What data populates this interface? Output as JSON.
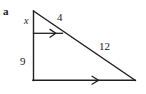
{
  "figure": {
    "part_label": "a",
    "stroke_color": "#231f20",
    "background_color": "#ffffff",
    "labels": {
      "upper_left_side": "x",
      "upper_hypotenuse_segment": "4",
      "lower_hypotenuse_segment": "12",
      "lower_left_side": "9"
    },
    "geometry": {
      "apex": [
        33,
        11
      ],
      "bottom_left": [
        33,
        80
      ],
      "bottom_right": [
        135,
        80
      ],
      "transversal_left": [
        33,
        33
      ],
      "transversal_right": [
        62.5,
        33
      ]
    },
    "markers": {
      "parallel_mark_upper": "single-arrowhead",
      "parallel_mark_lower": "single-arrowhead"
    }
  }
}
